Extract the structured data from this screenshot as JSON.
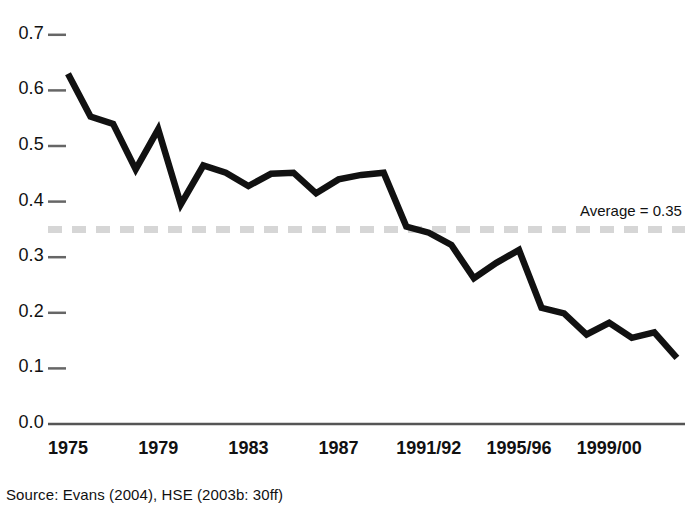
{
  "chart_data": {
    "type": "line",
    "title": "",
    "subtitle": "",
    "xlabel": "",
    "ylabel": "",
    "ylim": [
      0.0,
      0.7
    ],
    "grid": false,
    "legend_position": "none",
    "y_ticks": [
      "0.7",
      "0.6",
      "0.5",
      "0.4",
      "0.3",
      "0.2",
      "0.1",
      "0.0"
    ],
    "y_tick_values": [
      0.7,
      0.6,
      0.5,
      0.4,
      0.3,
      0.2,
      0.1,
      0.0
    ],
    "x_ticks": [
      "1975",
      "1979",
      "1983",
      "1987",
      "1991/92",
      "1995/96",
      "1999/00"
    ],
    "x_tick_indices": [
      0,
      4,
      8,
      12,
      16,
      20,
      24
    ],
    "x": [
      "1975",
      "1976",
      "1977",
      "1978",
      "1979",
      "1980",
      "1981",
      "1982",
      "1983",
      "1984",
      "1985",
      "1986",
      "1987",
      "1988",
      "1989",
      "1990",
      "1991/92",
      "1992/93",
      "1993/94",
      "1994/95",
      "1995/96",
      "1996/97",
      "1997/98",
      "1998/99",
      "1999/00",
      "2000/01",
      "2001/02",
      "2002/03"
    ],
    "values": [
      0.63,
      0.553,
      0.54,
      0.458,
      0.53,
      0.395,
      0.465,
      0.452,
      0.428,
      0.45,
      0.452,
      0.415,
      0.44,
      0.448,
      0.452,
      0.355,
      0.344,
      0.322,
      0.262,
      0.29,
      0.313,
      0.209,
      0.199,
      0.161,
      0.182,
      0.155,
      0.165,
      0.119
    ],
    "series": [
      {
        "name": "rate",
        "color": "#111111",
        "values": [
          0.63,
          0.553,
          0.54,
          0.458,
          0.53,
          0.395,
          0.465,
          0.452,
          0.428,
          0.45,
          0.452,
          0.415,
          0.44,
          0.448,
          0.452,
          0.355,
          0.344,
          0.322,
          0.262,
          0.29,
          0.313,
          0.209,
          0.199,
          0.161,
          0.182,
          0.155,
          0.165,
          0.119
        ]
      }
    ],
    "reference_line": {
      "label": "Average = 0.35",
      "value": 0.35,
      "style": "dashed",
      "color": "#d6d6d6"
    },
    "source": "Source: Evans (2004), HSE (2003b: 30ff)"
  },
  "colors": {
    "line": "#111111",
    "axis": "#555555",
    "average_line": "#d6d6d6",
    "text": "#111111",
    "background": "#ffffff"
  }
}
